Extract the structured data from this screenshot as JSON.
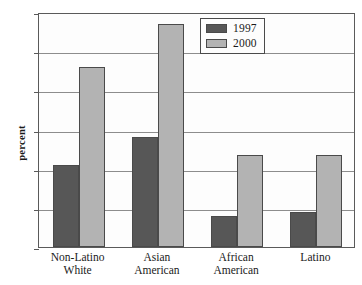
{
  "chart_data": {
    "type": "bar",
    "title": "",
    "subtitle": "",
    "xlabel": "",
    "ylabel": "percent",
    "ylim": [
      0,
      60
    ],
    "ytick_values": [
      0,
      10,
      20,
      30,
      40,
      50,
      60
    ],
    "ytick_labels": [
      "0",
      "10",
      "20",
      "30",
      "40",
      "50",
      "60"
    ],
    "grid": true,
    "grid_axis": "y",
    "legend_position": "inside upper-right",
    "categories": [
      "Non-Latino White",
      "Asian American",
      "African American",
      "Latino"
    ],
    "category_lines": [
      [
        "Non-Latino",
        "White"
      ],
      [
        "Asian",
        "American"
      ],
      [
        "African",
        "American"
      ],
      [
        "Latino",
        ""
      ]
    ],
    "series": [
      {
        "name": "1997",
        "color": "#575757",
        "values": [
          21,
          28,
          8,
          9
        ]
      },
      {
        "name": "2000",
        "color": "#b3b3b3",
        "values": [
          46,
          57,
          23.5,
          23.5
        ]
      }
    ]
  },
  "legend": {
    "entries": [
      {
        "label": "1997"
      },
      {
        "label": "2000"
      }
    ]
  },
  "colors": {
    "series_1997": "#575757",
    "series_2000": "#b3b3b3",
    "axis": "#5a5a5a",
    "gridline": "#8d8d8d",
    "background": "#ffffff"
  }
}
